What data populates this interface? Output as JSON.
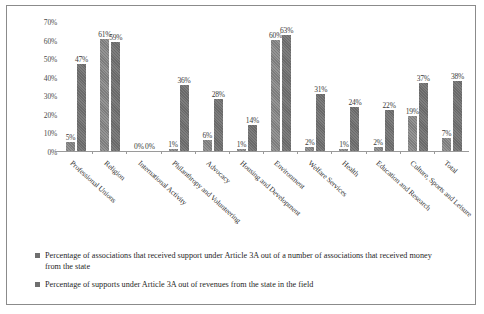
{
  "chart_data": {
    "type": "bar",
    "title": "",
    "xlabel": "",
    "ylabel": "",
    "ylim": [
      0,
      70
    ],
    "grid": false,
    "legend_position": "bottom-left",
    "y_ticks": [
      "0%",
      "10%",
      "20%",
      "30%",
      "40%",
      "50%",
      "60%",
      "70%"
    ],
    "y_tick_values": [
      0,
      10,
      20,
      30,
      40,
      50,
      60,
      70
    ],
    "categories": [
      "Professional Unions",
      "Religion",
      "International Activity",
      "Philanthropy and Volunteering",
      "Advocacy",
      "Housing and Development",
      "Environment",
      "Welfare Services",
      "Health",
      "Education and Research",
      "Culture, Sports and Leisure",
      "Total"
    ],
    "series": [
      {
        "name": "Percentage of associations that received support under Article 3A out of a number of associations that received money from the state",
        "color": "#818181",
        "values": [
          5,
          61,
          0,
          1,
          6,
          1,
          60,
          2,
          1,
          2,
          19,
          7
        ],
        "labels": [
          "5%",
          "61%",
          "0%",
          "1%",
          "6%",
          "1%",
          "60%",
          "2%",
          "1%",
          "2%",
          "19%",
          "7%"
        ]
      },
      {
        "name": "Percentage of supports under Article 3A out of revenues from the state in the field",
        "color": "#6f6f6f",
        "values": [
          47,
          59,
          0,
          36,
          28,
          14,
          63,
          31,
          24,
          22,
          37,
          38
        ],
        "labels": [
          "47%",
          "59%",
          "0%",
          "36%",
          "28%",
          "14%",
          "63%",
          "31%",
          "24%",
          "22%",
          "37%",
          "38%"
        ]
      }
    ]
  },
  "legend": [
    {
      "swatch_color": "#6f6f6f",
      "text": "Percentage of associations that received support under Article 3A out of a number of associations that received money from the state"
    },
    {
      "swatch_color": "#6f6f6f",
      "text": "Percentage of supports under Article 3A out of revenues from the state in the field"
    }
  ]
}
